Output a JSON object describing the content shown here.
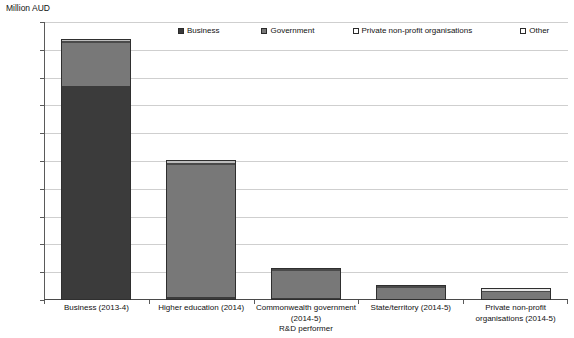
{
  "axis": {
    "y_title": "Million AUD",
    "y_ticks": [
      "20000",
      "18000",
      "16000",
      "14000",
      "12000",
      "10000",
      "8000",
      "6000",
      "4000",
      "2000",
      "0"
    ]
  },
  "legend": {
    "items": [
      {
        "label": "Business",
        "swatch": "#3b3b3b",
        "icon": "legend-swatch-icon"
      },
      {
        "label": "Government",
        "swatch": "#787878",
        "icon": "legend-swatch-icon"
      },
      {
        "label": "Private non-profit organisations",
        "swatch": "#ffffff",
        "icon": "legend-swatch-icon"
      },
      {
        "label": "Other",
        "swatch": "#ffffff",
        "icon": "legend-swatch-icon"
      }
    ]
  },
  "chart_data": {
    "type": "bar",
    "stacked": true,
    "title": "",
    "xlabel": "",
    "ylabel": "Million AUD",
    "ylim": [
      0,
      20000
    ],
    "ytick_step": 2000,
    "grid": true,
    "legend_position": "top",
    "categories": [
      "Business (2013-4)",
      "Higher education (2014)",
      "Commonwealth government (2014-5) R&D performer",
      "State/territory (2014-5)",
      "Private non-profit organisations (2014-5)"
    ],
    "category_lines": [
      [
        "Business (2013-4)"
      ],
      [
        "Higher education (2014)"
      ],
      [
        "Commonwealth government",
        "(2014-5)",
        "R&D performer"
      ],
      [
        "State/territory (2014-5)"
      ],
      [
        "Private non-profit",
        "organisations (2014-5)"
      ]
    ],
    "series": [
      {
        "name": "Business",
        "color": "#3b3b3b",
        "values": [
          15400,
          200,
          120,
          60,
          60
        ]
      },
      {
        "name": "Government",
        "color": "#787878",
        "values": [
          3100,
          9500,
          2100,
          1000,
          520
        ]
      },
      {
        "name": "Private non-profit organisations",
        "color": "#e8e8e8",
        "values": [
          150,
          150,
          30,
          20,
          300
        ]
      },
      {
        "name": "Other",
        "color": "#bdbdbd",
        "values": [
          150,
          250,
          20,
          20,
          20
        ]
      }
    ],
    "totals": [
      18800,
      10100,
      2270,
      1100,
      900
    ]
  }
}
